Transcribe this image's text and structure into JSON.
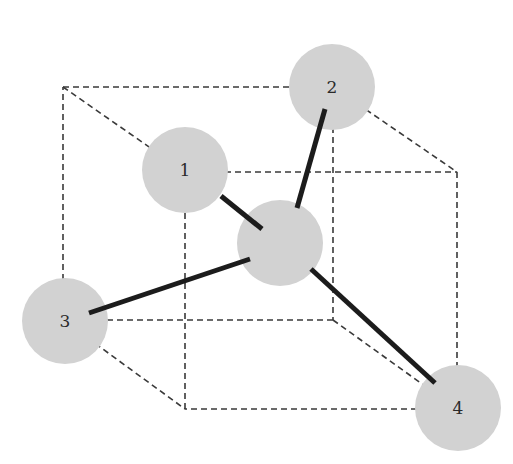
{
  "diagram": {
    "type": "tetrahedral-molecule-in-cube",
    "colors": {
      "atom_fill": "#d2d2d2",
      "bond": "#1c1c1c",
      "cube_edge": "#3a3a3a",
      "background": "#ffffff"
    },
    "cube": {
      "back_face": [
        [
          63,
          87
        ],
        [
          333,
          87
        ],
        [
          333,
          320
        ],
        [
          63,
          320
        ]
      ],
      "front_face": [
        [
          185,
          172
        ],
        [
          457,
          172
        ],
        [
          457,
          409
        ],
        [
          185,
          409
        ]
      ]
    },
    "center_atom": {
      "x": 280,
      "y": 243,
      "r": 43,
      "label": ""
    },
    "atoms": [
      {
        "id": 1,
        "label": "1",
        "x": 185,
        "y": 170,
        "r": 43
      },
      {
        "id": 2,
        "label": "2",
        "x": 332,
        "y": 87,
        "r": 43
      },
      {
        "id": 3,
        "label": "3",
        "x": 65,
        "y": 321,
        "r": 43
      },
      {
        "id": 4,
        "label": "4",
        "x": 458,
        "y": 408,
        "r": 43
      }
    ],
    "bonds": [
      {
        "from": "center",
        "to": 1,
        "x1": 262,
        "y1": 229,
        "x2": 221,
        "y2": 196
      },
      {
        "from": "center",
        "to": 2,
        "x1": 297,
        "y1": 208,
        "x2": 325,
        "y2": 109
      },
      {
        "from": "center",
        "to": 3,
        "x1": 250,
        "y1": 259,
        "x2": 89,
        "y2": 313
      },
      {
        "from": "center",
        "to": 4,
        "x1": 311,
        "y1": 269,
        "x2": 435,
        "y2": 383
      }
    ]
  }
}
